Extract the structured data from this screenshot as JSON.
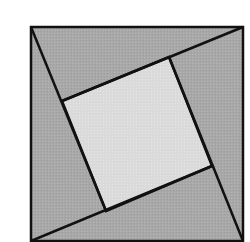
{
  "diagram": {
    "type": "pythagorean-square-proof",
    "colors": {
      "background": "#ffffff",
      "triangle_fill": "#a9a9a9",
      "inner_square_fill": "#dcdcdc",
      "stroke": "#111111"
    },
    "outer_square": {
      "x1": 31,
      "y1": 27,
      "x2": 243,
      "y2": 241
    },
    "inner_square_points": [
      [
        62,
        101
      ],
      [
        169,
        57
      ],
      [
        212,
        166
      ],
      [
        106,
        211
      ]
    ],
    "triangles": [
      {
        "name": "top",
        "points": [
          [
            31,
            27
          ],
          [
            243,
            27
          ],
          [
            169,
            57
          ],
          [
            62,
            101
          ]
        ]
      },
      {
        "name": "right",
        "points": [
          [
            243,
            27
          ],
          [
            243,
            241
          ],
          [
            212,
            166
          ],
          [
            169,
            57
          ]
        ]
      },
      {
        "name": "bottom",
        "points": [
          [
            243,
            241
          ],
          [
            31,
            241
          ],
          [
            106,
            211
          ],
          [
            212,
            166
          ]
        ]
      },
      {
        "name": "left",
        "points": [
          [
            31,
            241
          ],
          [
            31,
            27
          ],
          [
            62,
            101
          ],
          [
            106,
            211
          ]
        ]
      }
    ]
  }
}
